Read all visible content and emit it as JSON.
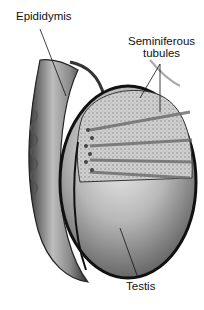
{
  "diagram": {
    "style": "grayscale medical illustration",
    "labels": [
      {
        "id": "epididymis",
        "text": "Epididymis"
      },
      {
        "id": "seminiferous",
        "line1": "Seminiferous",
        "line2": "tubules"
      },
      {
        "id": "testis",
        "text": "Testis"
      }
    ],
    "colors": {
      "background": "#ffffff",
      "outline": "#1a1a1a",
      "tissue_light": "#d9d9d9",
      "tissue_mid": "#9a9a9a",
      "tissue_dark": "#4a4a4a"
    }
  }
}
